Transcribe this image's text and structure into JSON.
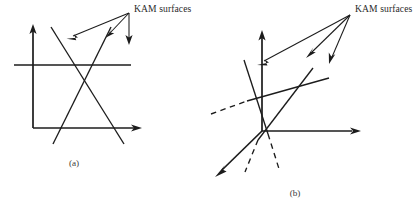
{
  "figure": {
    "background_color": "#ffffff",
    "ink_color": "#1c1c1c",
    "width": 417,
    "height": 208,
    "panels": [
      {
        "id": "a",
        "caption": "(a)",
        "annotation_label": "KAM surfaces",
        "annotation_arrow_count": 3,
        "axis_type": "2d-cartesian",
        "axes": [
          {
            "name": "vertical-axis",
            "arrow": "up"
          },
          {
            "name": "horizontal-axis",
            "arrow": "right"
          }
        ],
        "kam_surface_lines": 2,
        "kam_surface_style": "solid-crossing-pair"
      },
      {
        "id": "b",
        "caption": "(b)",
        "annotation_label": "KAM surfaces",
        "annotation_arrow_count": 3,
        "axis_type": "3d-perspective",
        "axes": [
          {
            "name": "vertical-axis",
            "arrow": "up"
          },
          {
            "name": "horizontal-axis",
            "arrow": "right"
          },
          {
            "name": "depth-axis",
            "arrow": "down-left"
          }
        ],
        "kam_surface_lines": 3,
        "kam_surface_style": "solid-with-dashed-hidden-segments",
        "dashed_hidden_lines": 3
      }
    ]
  }
}
